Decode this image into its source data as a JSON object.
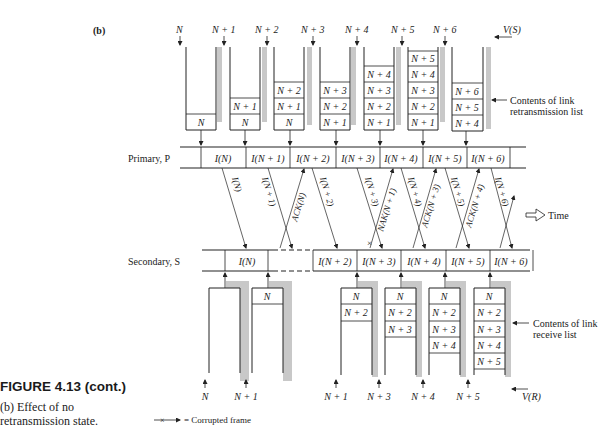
{
  "figure": {
    "panel_label": "(b)",
    "caption_title": "FIGURE 4.13 (cont.)",
    "caption_line1": "(b) Effect of no",
    "caption_line2": "retransmission state."
  },
  "primary": {
    "label": "Primary, P",
    "frames": [
      "I(N)",
      "I(N + 1)",
      "I(N + 2)",
      "I(N + 3)",
      "I(N + 4)",
      "I(N + 5)",
      "I(N + 6)"
    ]
  },
  "secondary": {
    "label": "Secondary, S",
    "frames": [
      "I(N)",
      "",
      "I(N + 2)",
      "I(N + 3)",
      "I(N + 4)",
      "I(N + 5)",
      "I(N + 6)"
    ]
  },
  "retransmission_lists": {
    "vs_labels": [
      "N",
      "N + 1",
      "N + 2",
      "N + 3",
      "N + 4",
      "N + 5",
      "N + 6"
    ],
    "vs_pointer_label": "V(S)",
    "annotation_line1": "Contents of link",
    "annotation_line2": "retransmission list",
    "lists": [
      [
        "N"
      ],
      [
        "N",
        "N + 1"
      ],
      [
        "N",
        "N + 1",
        "N + 2"
      ],
      [
        "N + 1",
        "N + 2",
        "N + 3"
      ],
      [
        "N + 1",
        "N + 2",
        "N + 3",
        "N + 4"
      ],
      [
        "N + 1",
        "N + 2",
        "N + 3",
        "N + 4",
        "N + 5"
      ],
      [
        "N + 4",
        "N + 5",
        "N + 6"
      ]
    ]
  },
  "receive_lists": {
    "vr_labels": [
      "N",
      "N + 1",
      "N + 1",
      "N + 3",
      "N + 4",
      "N + 5"
    ],
    "vr_pointer_label": "V(R)",
    "annotation_line1": "Contents of link",
    "annotation_line2": "receive list",
    "lists": [
      [],
      [
        "N"
      ],
      [
        "N",
        "N + 2"
      ],
      [
        "N",
        "N + 2",
        "N + 3"
      ],
      [
        "N",
        "N + 2",
        "N + 3",
        "N + 4"
      ],
      [
        "N",
        "N + 2",
        "N + 3",
        "N + 4",
        "N + 5"
      ]
    ]
  },
  "messages": {
    "down": [
      "I(N)",
      "I(N + 1)",
      "I(N + 2)",
      "I(N + 3)",
      "I(N + 4)",
      "I(N + 5)",
      "I(N + 6)"
    ],
    "up": [
      "ACK(N)",
      "NAK(N + 1)",
      "ACK(N + 3)",
      "ACK(N + 4)"
    ]
  },
  "time_label": "Time",
  "legend": {
    "corrupted_label": "= Corrupted frame"
  }
}
